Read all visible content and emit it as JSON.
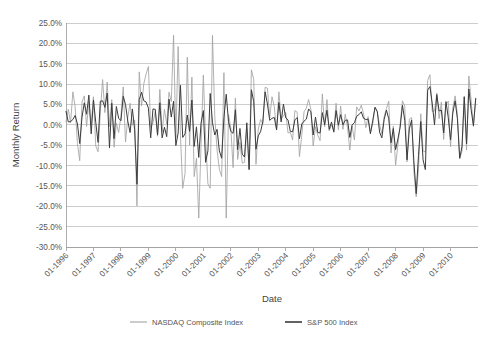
{
  "chart_data": {
    "type": "line",
    "title": "",
    "xlabel": "Date",
    "ylabel": "Monthly Return",
    "grid": true,
    "legend_position": "bottom",
    "ylim": [
      -30,
      25
    ],
    "ytick_step": 5,
    "ytick_labels": [
      "25.0%",
      "20.0%",
      "15.0%",
      "10.0%",
      "5.0%",
      "0.0%",
      "-5.0%",
      "-10.0%",
      "-15.0%",
      "-20.0%",
      "-25.0%",
      "-30.0%"
    ],
    "ytick_values": [
      25,
      20,
      15,
      10,
      5,
      0,
      -5,
      -10,
      -15,
      -20,
      -25,
      -30
    ],
    "xtick_labels": [
      "01-1996",
      "01-1997",
      "01-1998",
      "01-1999",
      "01-2000",
      "01-2001",
      "01-2002",
      "01-2003",
      "01-2004",
      "01-2005",
      "01-2006",
      "01-2007",
      "01-2008",
      "01-2009",
      "01-2010"
    ],
    "x_start": "01-1996",
    "x_end": "12-2010",
    "x_unit": "month",
    "series": [
      {
        "name": "NASDAQ Composite Index",
        "color": "#a3a3a3",
        "values": [
          0.7,
          3.8,
          0.5,
          8.1,
          4.4,
          -4.6,
          -8.8,
          5.6,
          7.1,
          -0.4,
          5.8,
          -0.1,
          6.9,
          -5.2,
          -6.6,
          3.2,
          11.1,
          3.0,
          10.5,
          -0.4,
          6.2,
          -5.5,
          0.4,
          -1.9,
          2.1,
          9.3,
          -4.2,
          1.8,
          5.3,
          -0.1,
          1.2,
          -19.9,
          13.0,
          4.6,
          10.1,
          12.5,
          14.3,
          -0.6,
          0.5,
          3.3,
          -2.8,
          8.7,
          -1.8,
          3.8,
          0.2,
          8.0,
          5.7,
          22.0,
          -3.2,
          19.2,
          -2.6,
          -15.6,
          -11.9,
          16.6,
          -5.0,
          11.7,
          -12.7,
          -8.2,
          -22.9,
          -4.9,
          12.2,
          -3.5,
          -14.5,
          -15.6,
          22.0,
          2.0,
          -6.2,
          -10.9,
          -12.7,
          12.8,
          -22.9,
          2.5,
          -0.8,
          -10.5,
          6.6,
          -8.5,
          -4.3,
          -9.4,
          -9.2,
          -1.0,
          -10.9,
          13.5,
          11.2,
          -9.7,
          -1.1,
          1.3,
          0.3,
          9.2,
          9.0,
          1.7,
          6.9,
          4.4,
          -1.3,
          8.1,
          1.5,
          2.2,
          3.1,
          -2.0,
          -1.8,
          -3.7,
          3.5,
          3.1,
          -7.8,
          -2.6,
          3.2,
          4.1,
          6.2,
          3.7,
          -5.2,
          -0.5,
          -2.6,
          -3.9,
          7.6,
          -0.5,
          6.2,
          -1.5,
          0.0,
          -1.5,
          5.3,
          -1.2,
          4.6,
          -1.1,
          2.6,
          -0.7,
          -6.2,
          -0.3,
          -3.7,
          4.4,
          3.4,
          4.8,
          2.7,
          -0.7,
          2.0,
          -1.9,
          0.2,
          4.3,
          3.1,
          0.0,
          -2.2,
          2.0,
          4.0,
          5.8,
          -6.9,
          -0.3,
          -9.9,
          -5.0,
          0.3,
          5.9,
          4.6,
          -9.1,
          1.4,
          1.8,
          -11.6,
          -17.7,
          -10.8,
          2.7,
          -6.4,
          -6.7,
          10.9,
          12.3,
          3.3,
          3.4,
          7.8,
          1.5,
          5.6,
          -3.6,
          4.9,
          5.8,
          -5.4,
          4.2,
          7.1,
          2.6,
          -8.3,
          -6.5,
          6.9,
          -6.2,
          12.0,
          5.9,
          -0.4,
          6.2
        ]
      },
      {
        "name": "S&P 500 Index",
        "color": "#3c3c3c",
        "values": [
          3.3,
          0.7,
          0.8,
          1.3,
          2.3,
          0.2,
          -4.6,
          1.9,
          5.4,
          2.6,
          7.3,
          -2.2,
          6.1,
          0.6,
          -4.3,
          5.8,
          5.9,
          4.3,
          7.8,
          -5.7,
          5.3,
          -3.4,
          4.5,
          1.6,
          1.0,
          7.0,
          5.0,
          0.9,
          -1.9,
          3.9,
          -1.2,
          -14.6,
          6.2,
          8.0,
          5.9,
          5.6,
          4.1,
          -3.2,
          3.9,
          3.8,
          -2.5,
          5.4,
          -3.2,
          -0.6,
          -2.9,
          6.3,
          1.9,
          5.8,
          -5.1,
          -2.0,
          9.7,
          -3.1,
          -2.2,
          2.4,
          -1.6,
          6.1,
          -5.3,
          -0.5,
          -8.0,
          0.4,
          3.5,
          -9.2,
          -6.4,
          7.7,
          0.5,
          -2.5,
          -1.1,
          -6.4,
          -8.2,
          1.8,
          7.5,
          0.8,
          -1.6,
          -2.1,
          3.7,
          -6.1,
          -0.9,
          -7.2,
          -7.9,
          0.5,
          -11.0,
          8.6,
          5.7,
          -6.0,
          -2.7,
          -1.7,
          0.8,
          8.1,
          5.1,
          1.1,
          1.6,
          1.8,
          -1.2,
          5.5,
          0.7,
          5.1,
          1.7,
          1.2,
          -1.6,
          -1.7,
          1.2,
          1.8,
          -3.4,
          0.2,
          0.9,
          1.4,
          3.9,
          3.2,
          -2.5,
          1.9,
          -1.9,
          -2.0,
          3.0,
          0.0,
          3.6,
          -1.1,
          0.7,
          -1.8,
          3.5,
          -0.1,
          2.5,
          0.0,
          1.1,
          1.2,
          -3.1,
          0.0,
          0.5,
          2.1,
          2.5,
          3.2,
          1.6,
          1.3,
          1.4,
          -2.2,
          1.0,
          4.3,
          3.3,
          -1.8,
          -3.2,
          1.3,
          3.6,
          1.5,
          -4.4,
          -0.9,
          -6.1,
          -3.5,
          -0.6,
          4.8,
          1.1,
          -8.6,
          -1.0,
          1.2,
          -9.1,
          -16.9,
          -7.5,
          0.8,
          -8.6,
          -11.0,
          8.5,
          9.4,
          5.3,
          0.0,
          7.4,
          3.4,
          3.6,
          -2.0,
          5.7,
          1.8,
          -3.7,
          2.9,
          5.9,
          1.5,
          -8.2,
          -5.4,
          6.9,
          -4.7,
          8.8,
          3.7,
          -0.2,
          6.5
        ]
      }
    ],
    "legend": [
      {
        "label": "NASDAQ Composite Index",
        "color": "#a3a3a3"
      },
      {
        "label": "S&P 500 Index",
        "color": "#3c3c3c"
      }
    ]
  }
}
